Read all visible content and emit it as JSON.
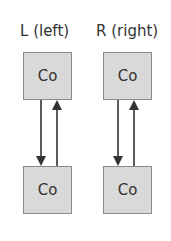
{
  "diagram": {
    "columns": [
      {
        "label": "L (left)",
        "top_box": "Co",
        "bottom_box": "Co"
      },
      {
        "label": "R (right)",
        "top_box": "Co",
        "bottom_box": "Co"
      }
    ],
    "colors": {
      "box_fill": "#d9d9d9",
      "box_border": "#8a8a8a",
      "arrow": "#333333",
      "text": "#333333"
    }
  }
}
